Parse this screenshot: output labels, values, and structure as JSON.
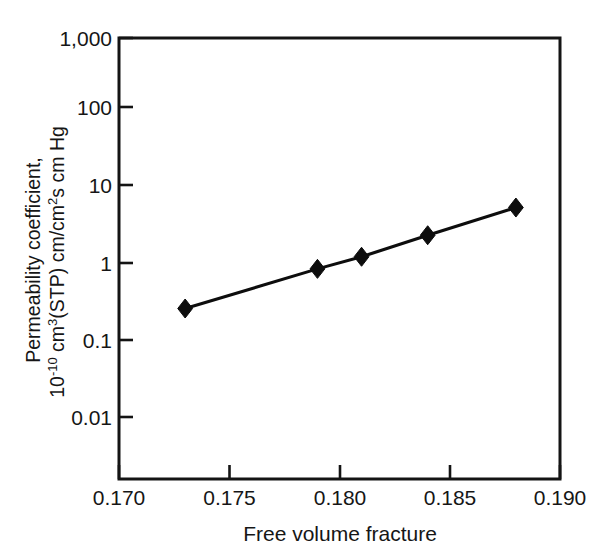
{
  "figure": {
    "background_color": "#ffffff",
    "ink_color": "#141414"
  },
  "chart_data": {
    "type": "line",
    "title": "",
    "xlabel": "Free volume fracture",
    "ylabel_line1": "Permeability coefficient,",
    "ylabel_line2_prefix": "10",
    "ylabel_line2_exponent": "-10",
    "ylabel_line2_rest_a": " cm",
    "ylabel_line2_exp_a": "3",
    "ylabel_line2_rest_b": "(STP) cm/cm",
    "ylabel_line2_exp_b": "2",
    "ylabel_line2_rest_c": "s cm Hg",
    "ylabel_full": "Permeability coefficient, 10-10 cm3(STP) cm/cm2s cm Hg",
    "yscale": "log",
    "xscale": "linear",
    "xlim": [
      0.17,
      0.19
    ],
    "ylim": [
      0.001,
      1000
    ],
    "xticks": [
      0.17,
      0.175,
      0.18,
      0.185,
      0.19
    ],
    "xtick_labels": [
      "0.170",
      "0.175",
      "0.180",
      "0.185",
      "0.190"
    ],
    "yticks": [
      1000,
      100,
      10,
      1,
      0.1,
      0.01
    ],
    "ytick_labels": [
      "1,000",
      "100",
      "10",
      "1",
      "0.1",
      "0.01"
    ],
    "grid": false,
    "legend": null,
    "marker": "diamond",
    "marker_color": "#0d0d0d",
    "line_color": "#0d0d0d",
    "series": [
      {
        "name": "Permeability vs free volume fracture",
        "x": [
          0.173,
          0.179,
          0.181,
          0.184,
          0.188
        ],
        "y": [
          0.27,
          0.9,
          1.3,
          2.5,
          5.8
        ]
      }
    ]
  }
}
